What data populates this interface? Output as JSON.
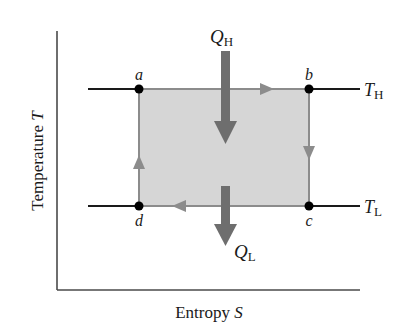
{
  "diagram": {
    "type": "Carnot cycle on T-S diagram",
    "axes": {
      "xlabel_word": "Entropy",
      "xlabel_symbol": "S",
      "ylabel_word": "Temperature",
      "ylabel_symbol": "T"
    },
    "points": [
      {
        "id": "a",
        "label": "a"
      },
      {
        "id": "b",
        "label": "b"
      },
      {
        "id": "c",
        "label": "c"
      },
      {
        "id": "d",
        "label": "d"
      }
    ],
    "isotherms": {
      "high": {
        "symbol": "T",
        "subscript": "H"
      },
      "low": {
        "symbol": "T",
        "subscript": "L"
      }
    },
    "heat_flows": {
      "in": {
        "symbol": "Q",
        "subscript": "H",
        "direction": "down-into-cycle"
      },
      "out": {
        "symbol": "Q",
        "subscript": "L",
        "direction": "down-out-of-cycle"
      }
    },
    "cycle_direction": [
      "a",
      "b",
      "c",
      "d",
      "a"
    ],
    "colors": {
      "axis": "#4a4a4a",
      "isotherm_line": "#1a1a1a",
      "cycle_edge": "#8c8c8c",
      "cycle_fill": "#d6d6d6",
      "heat_arrow": "#6e6e6e",
      "point": "#000000"
    }
  }
}
